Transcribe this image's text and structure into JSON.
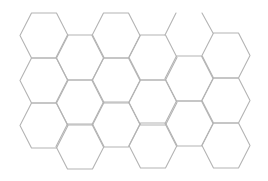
{
  "diagram": {
    "type": "hexagonal-grid",
    "orientation": "flat-top",
    "background": "#ffffff",
    "stroke_color": "#b4b4b4",
    "stroke_width": 1.1,
    "hex": {
      "half_width": 24,
      "top_half": 12.5,
      "height": 45
    },
    "columns": [
      {
        "cx": 44,
        "tops": [
          13,
          58,
          103
        ]
      },
      {
        "cx": 80,
        "tops": [
          35,
          80,
          124
        ]
      },
      {
        "cx": 116,
        "tops": [
          13,
          58,
          102
        ]
      },
      {
        "cx": 153,
        "tops": [
          35,
          80,
          123
        ]
      },
      {
        "cx": 189,
        "tops": [
          56,
          101
        ]
      },
      {
        "cx": 226,
        "tops": [
          33,
          78,
          123
        ]
      }
    ],
    "partial_lines": [
      {
        "x1": 165,
        "y1": 35,
        "x2": 176,
        "y2": 13
      },
      {
        "x1": 213,
        "y1": 33,
        "x2": 202,
        "y2": 13
      }
    ],
    "hex_count": 17
  }
}
